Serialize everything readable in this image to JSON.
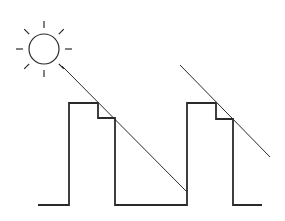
{
  "diagram": {
    "colors": {
      "stroke": "#2a2a2a",
      "background": "#ffffff"
    },
    "sun": {
      "cx": 44,
      "cy": 49,
      "r": 15,
      "ray_inner": 21,
      "ray_outer": 28,
      "ray_count": 8
    },
    "light_rays": [
      {
        "x1": 62,
        "y1": 66,
        "x2": 187,
        "y2": 192
      },
      {
        "x1": 180,
        "y1": 65,
        "x2": 270,
        "y2": 157
      }
    ],
    "profile_points": "38,205 69,205 69,103 98,103 98,118 115,118 115,205 187,205 187,103 216,103 216,119 233,119 233,205 262,205"
  }
}
